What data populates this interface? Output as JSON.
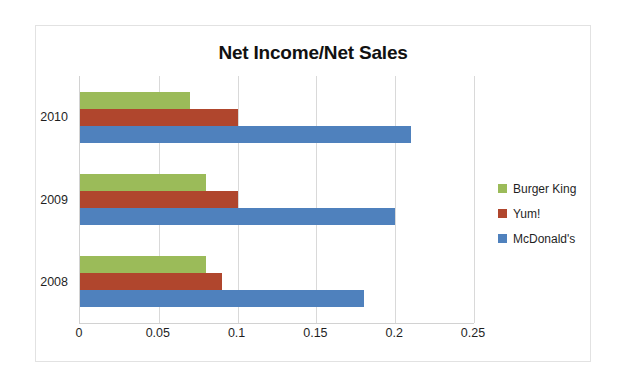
{
  "chart_data": {
    "type": "bar",
    "orientation": "horizontal",
    "title": "Net Income/Net Sales",
    "xlabel": "",
    "ylabel": "",
    "categories": [
      "2008",
      "2009",
      "2010"
    ],
    "category_order_top_to_bottom": [
      "2010",
      "2009",
      "2008"
    ],
    "series": [
      {
        "name": "Burger King",
        "color": "#9BBB59",
        "values": [
          0.08,
          0.08,
          0.07
        ]
      },
      {
        "name": "Yum!",
        "color": "#B0462D",
        "values": [
          0.09,
          0.1,
          0.1
        ]
      },
      {
        "name": "McDonald's",
        "color": "#4F81BD",
        "values": [
          0.18,
          0.2,
          0.21
        ]
      }
    ],
    "xlim": [
      0,
      0.25
    ],
    "xticks": [
      0,
      0.05,
      0.1,
      0.15,
      0.2,
      0.25
    ],
    "xtick_labels": [
      "0",
      "0.05",
      "0.1",
      "0.15",
      "0.2",
      "0.25"
    ],
    "grid": "vertical",
    "legend_position": "right"
  },
  "legend": {
    "items": [
      {
        "label": "Burger King",
        "color": "#9BBB59"
      },
      {
        "label": "Yum!",
        "color": "#B0462D"
      },
      {
        "label": "McDonald's",
        "color": "#4F81BD"
      }
    ]
  }
}
